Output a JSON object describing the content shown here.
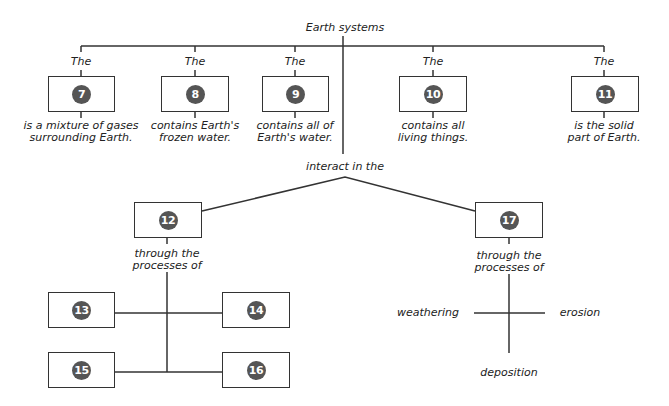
{
  "title": "Earth systems",
  "top_boxes": [
    {
      "prefix": "The",
      "number": "7",
      "desc_line1": "is a mixture of gases",
      "desc_line2": "surrounding Earth."
    },
    {
      "prefix": "The",
      "number": "8",
      "desc_line1": "contains Earth's",
      "desc_line2": "frozen water."
    },
    {
      "prefix": "The",
      "number": "9",
      "desc_line1": "contains all of",
      "desc_line2": "Earth's water."
    },
    {
      "prefix": "The",
      "number": "10",
      "desc_line1": "contains all",
      "desc_line2": "living things."
    },
    {
      "prefix": "The",
      "number": "11",
      "desc_line1": "is the solid",
      "desc_line2": "part of Earth."
    }
  ],
  "interact_label": "interact in the",
  "left_branch": {
    "number": "12",
    "through_line1": "through the",
    "through_line2": "processes of",
    "children": [
      "13",
      "14",
      "15",
      "16"
    ]
  },
  "right_branch": {
    "number": "17",
    "through_line1": "through the",
    "through_line2": "processes of",
    "processes": {
      "left": "weathering",
      "right": "erosion",
      "bottom": "deposition"
    }
  }
}
